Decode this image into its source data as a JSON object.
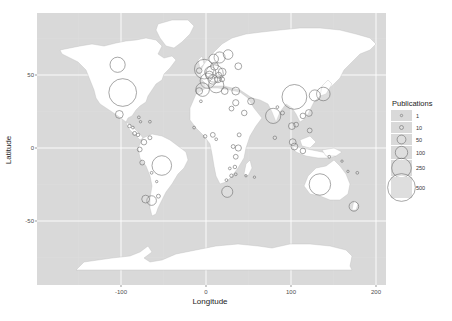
{
  "chart_data": {
    "type": "scatter",
    "subtype": "bubble-map",
    "title": "",
    "xlabel": "Longitude",
    "ylabel": "Latitude",
    "xlim": [
      -200,
      210
    ],
    "ylim": [
      -90,
      90
    ],
    "x_ticks": [
      -100,
      0,
      100,
      200
    ],
    "y_ticks": [
      50,
      0,
      -50
    ],
    "grid": true,
    "background": "#d9d9d9",
    "land_color": "#ffffff",
    "legend": {
      "title": "Publications",
      "position": "right",
      "entries": [
        {
          "label": "1",
          "value": 1
        },
        {
          "label": "10",
          "value": 10
        },
        {
          "label": "50",
          "value": 50
        },
        {
          "label": "100",
          "value": 100
        },
        {
          "label": "250",
          "value": 250
        },
        {
          "label": "500",
          "value": 500
        }
      ]
    },
    "points": [
      {
        "region": "USA",
        "lon": -98,
        "lat": 38,
        "publications": 500
      },
      {
        "region": "Canada",
        "lon": -104,
        "lat": 57,
        "publications": 150
      },
      {
        "region": "Mexico",
        "lon": -102,
        "lat": 23,
        "publications": 40
      },
      {
        "region": "Cuba",
        "lon": -79,
        "lat": 21,
        "publications": 5
      },
      {
        "region": "Guatemala",
        "lon": -90,
        "lat": 15,
        "publications": 8
      },
      {
        "region": "Honduras",
        "lon": -86,
        "lat": 14,
        "publications": 5
      },
      {
        "region": "Costa Rica",
        "lon": -84,
        "lat": 10,
        "publications": 10
      },
      {
        "region": "Panama",
        "lon": -80,
        "lat": 9,
        "publications": 8
      },
      {
        "region": "Jamaica",
        "lon": -77,
        "lat": 18,
        "publications": 3
      },
      {
        "region": "Puerto Rico",
        "lon": -66,
        "lat": 18,
        "publications": 5
      },
      {
        "region": "Colombia",
        "lon": -73,
        "lat": 4,
        "publications": 20
      },
      {
        "region": "Venezuela",
        "lon": -66,
        "lat": 7,
        "publications": 10
      },
      {
        "region": "Ecuador",
        "lon": -78,
        "lat": -1,
        "publications": 15
      },
      {
        "region": "Peru",
        "lon": -75,
        "lat": -10,
        "publications": 15
      },
      {
        "region": "Brazil",
        "lon": -52,
        "lat": -12,
        "publications": 250
      },
      {
        "region": "Bolivia",
        "lon": -64,
        "lat": -17,
        "publications": 5
      },
      {
        "region": "Paraguay",
        "lon": -58,
        "lat": -23,
        "publications": 3
      },
      {
        "region": "Chile",
        "lon": -71,
        "lat": -35,
        "publications": 40
      },
      {
        "region": "Argentina",
        "lon": -64,
        "lat": -36,
        "publications": 60
      },
      {
        "region": "Uruguay",
        "lon": -56,
        "lat": -33,
        "publications": 10
      },
      {
        "region": "UK",
        "lon": -2,
        "lat": 54,
        "publications": 250
      },
      {
        "region": "Ireland",
        "lon": -8,
        "lat": 53,
        "publications": 20
      },
      {
        "region": "France",
        "lon": 2,
        "lat": 46,
        "publications": 150
      },
      {
        "region": "Spain",
        "lon": -4,
        "lat": 40,
        "publications": 120
      },
      {
        "region": "Portugal",
        "lon": -8,
        "lat": 39,
        "publications": 30
      },
      {
        "region": "Germany",
        "lon": 10,
        "lat": 51,
        "publications": 200
      },
      {
        "region": "Netherlands",
        "lon": 5,
        "lat": 52,
        "publications": 80
      },
      {
        "region": "Belgium",
        "lon": 4,
        "lat": 50,
        "publications": 40
      },
      {
        "region": "Switzerland",
        "lon": 8,
        "lat": 47,
        "publications": 60
      },
      {
        "region": "Italy",
        "lon": 12,
        "lat": 43,
        "publications": 150
      },
      {
        "region": "Austria",
        "lon": 14,
        "lat": 47,
        "publications": 30
      },
      {
        "region": "Denmark",
        "lon": 10,
        "lat": 56,
        "publications": 40
      },
      {
        "region": "Norway",
        "lon": 9,
        "lat": 61,
        "publications": 60
      },
      {
        "region": "Sweden",
        "lon": 16,
        "lat": 62,
        "publications": 80
      },
      {
        "region": "Finland",
        "lon": 26,
        "lat": 64,
        "publications": 60
      },
      {
        "region": "Poland",
        "lon": 19,
        "lat": 52,
        "publications": 40
      },
      {
        "region": "Czech Republic",
        "lon": 15,
        "lat": 50,
        "publications": 20
      },
      {
        "region": "Hungary",
        "lon": 19,
        "lat": 47,
        "publications": 15
      },
      {
        "region": "Greece",
        "lon": 22,
        "lat": 39,
        "publications": 30
      },
      {
        "region": "Turkey",
        "lon": 35,
        "lat": 39,
        "publications": 40
      },
      {
        "region": "Russia",
        "lon": 38,
        "lat": 56,
        "publications": 30
      },
      {
        "region": "Israel",
        "lon": 35,
        "lat": 31,
        "publications": 25
      },
      {
        "region": "Iran",
        "lon": 53,
        "lat": 32,
        "publications": 30
      },
      {
        "region": "Saudi Arabia",
        "lon": 45,
        "lat": 24,
        "publications": 20
      },
      {
        "region": "Egypt",
        "lon": 30,
        "lat": 27,
        "publications": 15
      },
      {
        "region": "Morocco",
        "lon": -6,
        "lat": 32,
        "publications": 5
      },
      {
        "region": "Nigeria",
        "lon": 8,
        "lat": 9,
        "publications": 15
      },
      {
        "region": "Ghana",
        "lon": -1,
        "lat": 8,
        "publications": 8
      },
      {
        "region": "Senegal",
        "lon": -14,
        "lat": 14,
        "publications": 5
      },
      {
        "region": "Cameroon",
        "lon": 12,
        "lat": 6,
        "publications": 5
      },
      {
        "region": "Ethiopia",
        "lon": 39,
        "lat": 9,
        "publications": 10
      },
      {
        "region": "Kenya",
        "lon": 38,
        "lat": 0,
        "publications": 25
      },
      {
        "region": "Uganda",
        "lon": 32,
        "lat": 1,
        "publications": 10
      },
      {
        "region": "Tanzania",
        "lon": 35,
        "lat": -6,
        "publications": 15
      },
      {
        "region": "Malawi",
        "lon": 34,
        "lat": -13,
        "publications": 8
      },
      {
        "region": "Zambia",
        "lon": 28,
        "lat": -14,
        "publications": 5
      },
      {
        "region": "Zimbabwe",
        "lon": 30,
        "lat": -19,
        "publications": 8
      },
      {
        "region": "Mozambique",
        "lon": 35,
        "lat": -18,
        "publications": 5
      },
      {
        "region": "Botswana",
        "lon": 24,
        "lat": -22,
        "publications": 5
      },
      {
        "region": "South Africa",
        "lon": 25,
        "lat": -30,
        "publications": 80
      },
      {
        "region": "Madagascar",
        "lon": 47,
        "lat": -19,
        "publications": 3
      },
      {
        "region": "Mauritius",
        "lon": 57,
        "lat": -20,
        "publications": 1
      },
      {
        "region": "India",
        "lon": 79,
        "lat": 22,
        "publications": 150
      },
      {
        "region": "Sri Lanka",
        "lon": 81,
        "lat": 7,
        "publications": 8
      },
      {
        "region": "Nepal",
        "lon": 84,
        "lat": 28,
        "publications": 5
      },
      {
        "region": "Bangladesh",
        "lon": 90,
        "lat": 24,
        "publications": 10
      },
      {
        "region": "China",
        "lon": 104,
        "lat": 35,
        "publications": 400
      },
      {
        "region": "Japan",
        "lon": 138,
        "lat": 37,
        "publications": 120
      },
      {
        "region": "South Korea",
        "lon": 128,
        "lat": 36,
        "publications": 80
      },
      {
        "region": "Taiwan",
        "lon": 121,
        "lat": 24,
        "publications": 30
      },
      {
        "region": "Hong Kong",
        "lon": 114,
        "lat": 22,
        "publications": 20
      },
      {
        "region": "Thailand",
        "lon": 101,
        "lat": 15,
        "publications": 30
      },
      {
        "region": "Vietnam",
        "lon": 106,
        "lat": 16,
        "publications": 15
      },
      {
        "region": "Philippines",
        "lon": 122,
        "lat": 12,
        "publications": 15
      },
      {
        "region": "Malaysia",
        "lon": 102,
        "lat": 4,
        "publications": 30
      },
      {
        "region": "Singapore",
        "lon": 104,
        "lat": 1,
        "publications": 30
      },
      {
        "region": "Indonesia",
        "lon": 114,
        "lat": -2,
        "publications": 20
      },
      {
        "region": "Papua New Guinea",
        "lon": 145,
        "lat": -6,
        "publications": 5
      },
      {
        "region": "Solomon Islands",
        "lon": 160,
        "lat": -9,
        "publications": 3
      },
      {
        "region": "Vanuatu",
        "lon": 167,
        "lat": -16,
        "publications": 3
      },
      {
        "region": "Fiji",
        "lon": 178,
        "lat": -17,
        "publications": 5
      },
      {
        "region": "Australia",
        "lon": 134,
        "lat": -25,
        "publications": 300
      },
      {
        "region": "New Zealand",
        "lon": 174,
        "lat": -40,
        "publications": 60
      }
    ]
  }
}
